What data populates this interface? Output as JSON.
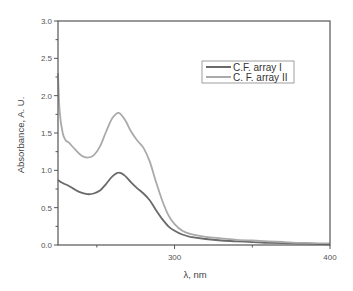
{
  "chart_data": {
    "type": "line",
    "title": "",
    "xlabel": "λ, nm",
    "ylabel": "Absorbance, A. U.",
    "xlim": [
      225,
      400
    ],
    "ylim": [
      0.0,
      3.0
    ],
    "grid": false,
    "legend_position": "upper right (inside)",
    "x_ticks": [
      {
        "value": 300,
        "label": "300"
      },
      {
        "value": 400,
        "label": "400"
      }
    ],
    "x_minor_ticks": [
      250,
      350
    ],
    "y_ticks": [
      {
        "value": 0.0,
        "label": "0.0"
      },
      {
        "value": 0.5,
        "label": "0.5"
      },
      {
        "value": 1.0,
        "label": "1.0"
      },
      {
        "value": 1.5,
        "label": "1.5"
      },
      {
        "value": 2.0,
        "label": "2.0"
      },
      {
        "value": 2.5,
        "label": "2.5"
      },
      {
        "value": 3.0,
        "label": "3.0"
      }
    ],
    "y_minor_ticks": [
      0.25,
      0.75,
      1.25,
      1.75,
      2.25,
      2.75
    ],
    "series": [
      {
        "name": "C.F. array I",
        "color": "#6a6a6a",
        "x": [
          225,
          228,
          232,
          236,
          240,
          244,
          248,
          252,
          256,
          260,
          264,
          268,
          272,
          276,
          280,
          284,
          288,
          292,
          296,
          300,
          305,
          310,
          320,
          330,
          340,
          350,
          360,
          370,
          380,
          390,
          400
        ],
        "y": [
          0.87,
          0.83,
          0.79,
          0.74,
          0.7,
          0.68,
          0.69,
          0.73,
          0.82,
          0.92,
          0.97,
          0.93,
          0.84,
          0.76,
          0.69,
          0.6,
          0.47,
          0.35,
          0.25,
          0.19,
          0.14,
          0.11,
          0.08,
          0.06,
          0.05,
          0.04,
          0.03,
          0.025,
          0.02,
          0.015,
          0.01
        ]
      },
      {
        "name": "C. F. array II",
        "color": "#aaaaaa",
        "x": [
          225,
          226,
          228,
          230,
          232,
          236,
          240,
          244,
          248,
          252,
          256,
          260,
          264,
          268,
          272,
          276,
          280,
          284,
          288,
          292,
          296,
          300,
          305,
          310,
          320,
          330,
          340,
          350,
          360,
          370,
          380,
          390,
          400
        ],
        "y": [
          2.3,
          1.8,
          1.5,
          1.4,
          1.37,
          1.28,
          1.2,
          1.17,
          1.2,
          1.32,
          1.52,
          1.7,
          1.77,
          1.68,
          1.52,
          1.4,
          1.3,
          1.12,
          0.85,
          0.6,
          0.4,
          0.28,
          0.19,
          0.15,
          0.11,
          0.09,
          0.07,
          0.06,
          0.05,
          0.04,
          0.03,
          0.025,
          0.02
        ]
      }
    ]
  },
  "legend": {
    "items": [
      {
        "label": "C.F. array I",
        "color": "#6a6a6a"
      },
      {
        "label": "C. F. array II",
        "color": "#aaaaaa"
      }
    ]
  },
  "axes": {
    "xlabel": "λ, nm",
    "ylabel": "Absorbance, A. U."
  }
}
